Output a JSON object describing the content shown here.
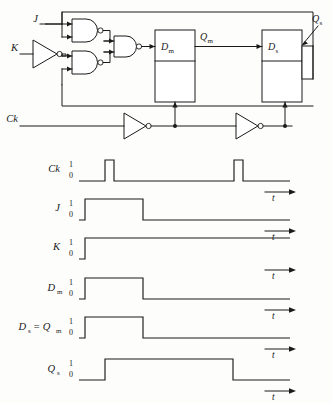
{
  "figure": {
    "kind": "jk-master-slave-flip-flop-schematic-and-timing-diagram",
    "colors": {
      "ink": "#1a1a1a",
      "paper": "#fdfdfc"
    }
  },
  "circuit": {
    "inputs": [
      {
        "name": "input-j",
        "label": "J"
      },
      {
        "name": "input-k",
        "label": "K"
      },
      {
        "name": "input-ck",
        "label": "Ck"
      }
    ],
    "blocks": [
      {
        "name": "master-latch",
        "input_label": "D",
        "input_sub": "m",
        "output_label": "Q",
        "output_sub": "m"
      },
      {
        "name": "slave-latch",
        "input_label": "D",
        "input_sub": "s",
        "output_label": "Q",
        "output_sub": "s"
      }
    ],
    "gates": [
      {
        "name": "nand-j",
        "type": "nand",
        "inputs": 2
      },
      {
        "name": "nand-k",
        "type": "nand",
        "inputs": 2
      },
      {
        "name": "nand-merge",
        "type": "nand",
        "inputs": 2
      },
      {
        "name": "inverter-k",
        "type": "inverter"
      },
      {
        "name": "inverter-ck-1",
        "type": "inverter"
      },
      {
        "name": "inverter-ck-2",
        "type": "inverter"
      }
    ],
    "labels": {
      "j": "J",
      "k": "K",
      "ck": "Ck",
      "dm": "D",
      "dm_sub": "m",
      "qm": "Q",
      "qm_sub": "m",
      "ds": "D",
      "ds_sub": "s",
      "qs": "Q",
      "qs_sub": "s"
    }
  },
  "timing": {
    "axis_label": "t",
    "level_high": "1",
    "level_low": "0",
    "rows": [
      {
        "name": "waveform-ck",
        "label": "Ck",
        "label_main": "Ck",
        "label_sub": "",
        "label_extra": "",
        "pulses": "two narrow positive pulses",
        "transitions": [
          {
            "x": 105,
            "level": 1
          },
          {
            "x": 114,
            "level": 0
          },
          {
            "x": 234,
            "level": 1
          },
          {
            "x": 243,
            "level": 0
          }
        ]
      },
      {
        "name": "waveform-j",
        "label": "J",
        "label_main": "J",
        "label_sub": "",
        "label_extra": "",
        "pulses": "single positive pulse",
        "transitions": [
          {
            "x": 85,
            "level": 1
          },
          {
            "x": 143,
            "level": 0
          }
        ]
      },
      {
        "name": "waveform-k",
        "label": "K",
        "label_main": "K",
        "label_sub": "",
        "label_extra": "",
        "pulses": "rises and stays high",
        "transitions": [
          {
            "x": 85,
            "level": 1
          }
        ]
      },
      {
        "name": "waveform-dm",
        "label": "Dm",
        "label_main": "D",
        "label_sub": "m",
        "label_extra": "",
        "pulses": "single positive pulse",
        "transitions": [
          {
            "x": 85,
            "level": 1
          },
          {
            "x": 143,
            "level": 0
          }
        ]
      },
      {
        "name": "waveform-ds-qm",
        "label": "Ds = Qm",
        "label_main": "D",
        "label_sub": "s",
        "label_extra": "= Q",
        "label_extra_sub": "m",
        "pulses": "single positive pulse",
        "transitions": [
          {
            "x": 85,
            "level": 1
          },
          {
            "x": 143,
            "level": 0
          }
        ]
      },
      {
        "name": "waveform-qs",
        "label": "Qs",
        "label_main": "Q",
        "label_sub": "s",
        "label_extra": "",
        "pulses": "single wide positive pulse",
        "transitions": [
          {
            "x": 105,
            "level": 1
          },
          {
            "x": 233,
            "level": 0
          }
        ]
      }
    ]
  }
}
